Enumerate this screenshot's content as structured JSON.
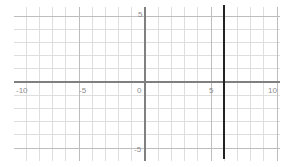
{
  "chart_data": {
    "type": "line",
    "title": "",
    "xlabel": "",
    "ylabel": "",
    "xlim": [
      -10.5,
      10.5
    ],
    "ylim": [
      -5.8,
      5.8
    ],
    "grid": true,
    "grid_minor_step": 1,
    "grid_major_step": 5,
    "legend": "none",
    "x_ticks": [
      -10,
      -5,
      0,
      5,
      10
    ],
    "x_tick_labels": [
      "-10",
      "-5",
      "0",
      "5",
      "10"
    ],
    "y_ticks": [
      -5,
      5
    ],
    "y_tick_labels": [
      "-5",
      "5"
    ],
    "series": [
      {
        "name": "vertical-line",
        "equation": "x = 6",
        "type": "vertical-line",
        "x": 6,
        "y_from": -5.8,
        "y_to": 5.8,
        "color": "#222222"
      }
    ],
    "colors": {
      "background": "#ffffff",
      "grid_minor": "#dedede",
      "grid_major": "#bdbdbd",
      "axis": "#808080",
      "tick_text": "#8c8c8c",
      "series_line": "#222222"
    }
  },
  "axis_labels": {
    "x_neg10": "-10",
    "x_neg5": "-5",
    "origin": "0",
    "x_pos5": "5",
    "x_pos10": "10",
    "y_pos5": "5",
    "y_neg5": "-5"
  }
}
